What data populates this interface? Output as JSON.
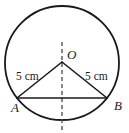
{
  "figure": {
    "type": "circle-geometry-diagram",
    "background_color": "#ffffff",
    "stroke_color": "#1a1a1a",
    "circle": {
      "name": "circle",
      "center_x": 62,
      "center_y": 63,
      "radius": 57,
      "stroke_width": 1.8
    },
    "center_point": {
      "name": "point-O",
      "label": "O",
      "x": 62,
      "y": 62,
      "label_x": 67,
      "label_y": 59
    },
    "point_a": {
      "name": "point-A",
      "label": "A",
      "x": 17,
      "y": 98,
      "label_x": 11,
      "label_y": 112
    },
    "point_b": {
      "name": "point-B",
      "label": "B",
      "x": 107,
      "y": 98,
      "label_x": 114,
      "label_y": 110
    },
    "chord": {
      "name": "chord-AB",
      "x1": 17,
      "y1": 98,
      "x2": 107,
      "y2": 98,
      "stroke_width": 1.6
    },
    "radius_left": {
      "name": "radius-OA",
      "x1": 62,
      "y1": 62,
      "x2": 17,
      "y2": 98,
      "stroke_width": 1.6,
      "label": "5 cm",
      "label_x": 16,
      "label_y": 80
    },
    "radius_right": {
      "name": "radius-OB",
      "x1": 62,
      "y1": 62,
      "x2": 107,
      "y2": 98,
      "stroke_width": 1.6,
      "label": "5 cm",
      "label_x": 85,
      "label_y": 80
    },
    "axis": {
      "name": "dashed-axis",
      "x": 62,
      "y_top": 42,
      "y_bottom": 131,
      "dash_pattern": "4,3",
      "stroke_width": 1.4
    }
  },
  "chart_data": {
    "type": "diagram",
    "title": "",
    "annotations": [
      {
        "text": "O",
        "role": "centre-point-label"
      },
      {
        "text": "A",
        "role": "endpoint-label"
      },
      {
        "text": "B",
        "role": "endpoint-label"
      },
      {
        "text": "5 cm",
        "role": "radius-length-left"
      },
      {
        "text": "5 cm",
        "role": "radius-length-right"
      }
    ],
    "measurements": [
      {
        "segment": "OA",
        "value": 5,
        "unit": "cm"
      },
      {
        "segment": "OB",
        "value": 5,
        "unit": "cm"
      }
    ]
  }
}
